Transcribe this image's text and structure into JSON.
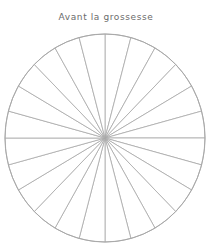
{
  "title": "Avant la grossesse",
  "wheel": {
    "segments": 24,
    "center": [
      105,
      138
    ],
    "rx": 100,
    "ry": 104,
    "stroke_color": "#a8a8a8",
    "fill_color": "#ffffff"
  },
  "colors": {
    "title": "#6b6b6b",
    "lines": "#a8a8a8"
  }
}
